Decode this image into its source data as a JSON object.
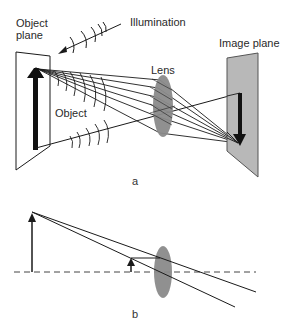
{
  "panel_a": {
    "label": "a",
    "object_plane_label_line1": "Object",
    "object_plane_label_line2": "plane",
    "illumination_label": "Illumination",
    "object_label": "Object",
    "lens_label": "Lens",
    "image_plane_label": "Image plane"
  },
  "panel_b": {
    "label": "b"
  },
  "colors": {
    "ink": "#1a1a1a",
    "lens_fill": "#8a8a8a",
    "image_plane_fill": "#b8b8b8",
    "image_plane_edge": "#555555",
    "axis_dash": "#444444"
  }
}
